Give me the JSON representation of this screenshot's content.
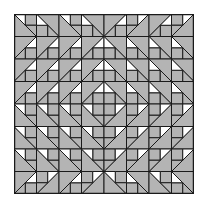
{
  "figure": {
    "title": "",
    "grid_cells": 8,
    "quadrant_rows": [
      [
        "\\BL",
        "\\TR",
        "\\BL",
        "\\TR"
      ],
      [
        "/TL",
        "/TL",
        "/TL",
        "/TL"
      ],
      [
        "/TL",
        "/TL",
        "/TL",
        "/TL"
      ],
      [
        "/TL",
        "/TL",
        "/TL",
        "/TL"
      ]
    ],
    "colors": {
      "fill_gray": "#b4b4b4",
      "fill_white": "#ffffff",
      "stroke": "#1a1a1a",
      "background": "#ffffff"
    }
  }
}
